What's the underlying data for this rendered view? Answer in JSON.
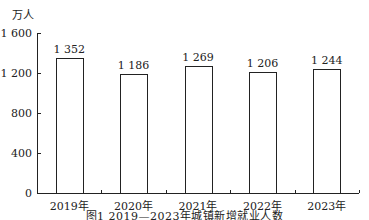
{
  "chart_data": {
    "type": "bar",
    "title": "图1 2019—2023年城镇新增就业人数",
    "unit_label": "万人",
    "xlabel": "",
    "ylabel": "万人",
    "categories": [
      "2019年",
      "2020年",
      "2021年",
      "2022年",
      "2023年"
    ],
    "values": [
      1352,
      1186,
      1269,
      1206,
      1244
    ],
    "value_labels": [
      "1 352",
      "1 186",
      "1 269",
      "1 206",
      "1 244"
    ],
    "ylim": [
      0,
      1600
    ],
    "yticks": [
      0,
      400,
      800,
      1200,
      1600
    ],
    "ytick_labels": [
      "0",
      "400",
      "800",
      "1 200",
      "1 600"
    ],
    "grid": false,
    "legend": null,
    "bar_fill": "#ffffff",
    "bar_stroke": "#222222"
  },
  "figure": {
    "unit": "万人",
    "caption": "图1 2019—2023年城镇新增就业人数"
  }
}
